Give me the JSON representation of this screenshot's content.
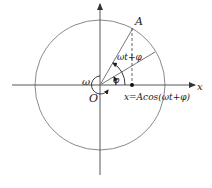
{
  "diagram": {
    "labels": {
      "point_A": "A",
      "origin": "O",
      "x_axis": "x",
      "angular_velocity": "ω",
      "phase_total": "ωt+φ",
      "initial_phase": "φ",
      "projection": "x=Acos(ωt+φ)"
    },
    "colors": {
      "circle": "#8a8a8a",
      "axes": "#333333",
      "vector": "#777777",
      "text": "#1a1a1a"
    }
  }
}
